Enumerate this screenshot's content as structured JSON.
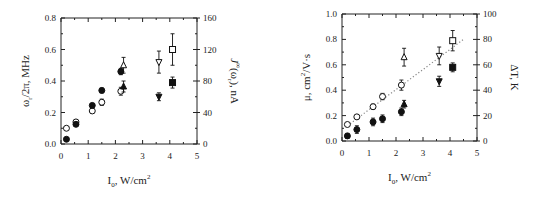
{
  "chart_data": [
    {
      "type": "scatter",
      "title": "",
      "xlabel": "I0, W/cm2",
      "xlabel_parts": {
        "main": "I",
        "sub": "0",
        "rest": ", W/cm",
        "sup": "2"
      },
      "ylabel": "ωr/2π, MHz",
      "ylabel_parts": {
        "main": "ω",
        "sub": "r",
        "rest": "/2π, MHz"
      },
      "y2label": "J∞(ωr), nA",
      "y2label_parts": {
        "main": "J",
        "sup": "∞",
        "mid": "(ω",
        "sub": "r",
        "rest": "), nA"
      },
      "xlim": [
        0,
        5
      ],
      "ylim": [
        0,
        0.8
      ],
      "y2lim": [
        0,
        160
      ],
      "xticks": [
        "0",
        "1",
        "2",
        "3",
        "4",
        "5"
      ],
      "yticks": [
        "0.0",
        "0.2",
        "0.4",
        "0.6",
        "0.8"
      ],
      "y2ticks": [
        "0",
        "40",
        "80",
        "120",
        "160"
      ],
      "grid": false,
      "series": [
        {
          "name": "open circles",
          "marker": "circle",
          "filled": false,
          "points": [
            {
              "x": 0.2,
              "y": 0.1,
              "err": 0.01
            },
            {
              "x": 0.55,
              "y": 0.14,
              "err": 0.012
            },
            {
              "x": 1.15,
              "y": 0.21,
              "err": 0.015
            },
            {
              "x": 1.5,
              "y": 0.265,
              "err": 0.02
            },
            {
              "x": 2.2,
              "y": 0.335,
              "err": 0.025
            }
          ]
        },
        {
          "name": "open up-triangle",
          "marker": "triangle-up",
          "filled": false,
          "points": [
            {
              "x": 2.3,
              "y": 0.5,
              "err": 0.05
            }
          ]
        },
        {
          "name": "open down-triangle",
          "marker": "triangle-down",
          "filled": false,
          "points": [
            {
              "x": 3.6,
              "y": 0.52,
              "err": 0.07
            }
          ]
        },
        {
          "name": "open square",
          "marker": "square",
          "filled": false,
          "points": [
            {
              "x": 4.1,
              "y": 0.6,
              "err": 0.1
            }
          ]
        },
        {
          "name": "filled circles",
          "marker": "circle",
          "filled": true,
          "points": [
            {
              "x": 0.2,
              "y": 0.03,
              "err": 0.005
            },
            {
              "x": 0.55,
              "y": 0.125,
              "err": 0.01
            },
            {
              "x": 1.15,
              "y": 0.245,
              "err": 0.012
            },
            {
              "x": 1.5,
              "y": 0.34,
              "err": 0.015
            },
            {
              "x": 2.2,
              "y": 0.46,
              "err": 0.02
            }
          ]
        },
        {
          "name": "filled up-triangle",
          "marker": "triangle-up",
          "filled": true,
          "points": [
            {
              "x": 2.3,
              "y": 0.365,
              "err": 0.035
            }
          ]
        },
        {
          "name": "filled down-triangle",
          "marker": "triangle-down",
          "filled": true,
          "points": [
            {
              "x": 3.6,
              "y": 0.3,
              "err": 0.025
            }
          ]
        },
        {
          "name": "filled square",
          "marker": "square",
          "filled": true,
          "points": [
            {
              "x": 4.1,
              "y": 0.39,
              "err": 0.035
            }
          ]
        }
      ]
    },
    {
      "type": "scatter",
      "title": "",
      "xlabel": "I0, W/cm2",
      "xlabel_parts": {
        "main": "I",
        "sub": "0",
        "rest": ", W/cm",
        "sup": "2"
      },
      "ylabel": "μ, cm2/V·s",
      "ylabel_parts": {
        "main": "μ, cm",
        "sup": "2",
        "rest": "/V·s"
      },
      "y2label": "ΔT, K",
      "xlim": [
        0,
        5
      ],
      "ylim": [
        0,
        1.0
      ],
      "y2lim": [
        0,
        100
      ],
      "xticks": [
        "0",
        "1",
        "2",
        "3",
        "4",
        "5"
      ],
      "yticks": [
        "0.0",
        "0.2",
        "0.4",
        "0.6",
        "0.8",
        "1.0"
      ],
      "y2ticks": [
        "0",
        "20",
        "40",
        "60",
        "80",
        "100"
      ],
      "grid": false,
      "fit_line": {
        "style": "dotted",
        "x": [
          0.2,
          4.5
        ],
        "y": [
          0.12,
          0.8
        ]
      },
      "series": [
        {
          "name": "open circles",
          "marker": "circle",
          "filled": false,
          "points": [
            {
              "x": 0.2,
              "y": 0.13,
              "err": 0.01
            },
            {
              "x": 0.55,
              "y": 0.19,
              "err": 0.012
            },
            {
              "x": 1.15,
              "y": 0.27,
              "err": 0.02
            },
            {
              "x": 1.5,
              "y": 0.35,
              "err": 0.025
            },
            {
              "x": 2.2,
              "y": 0.44,
              "err": 0.04
            }
          ]
        },
        {
          "name": "open up-triangle",
          "marker": "triangle-up",
          "filled": false,
          "points": [
            {
              "x": 2.3,
              "y": 0.66,
              "err": 0.07
            }
          ]
        },
        {
          "name": "open down-triangle",
          "marker": "triangle-down",
          "filled": false,
          "points": [
            {
              "x": 3.6,
              "y": 0.67,
              "err": 0.07
            }
          ]
        },
        {
          "name": "open square",
          "marker": "square",
          "filled": false,
          "points": [
            {
              "x": 4.1,
              "y": 0.79,
              "err": 0.08
            }
          ]
        },
        {
          "name": "filled circles",
          "marker": "circle",
          "filled": true,
          "points": [
            {
              "x": 0.2,
              "y": 0.04,
              "err": 0.02
            },
            {
              "x": 0.55,
              "y": 0.09,
              "err": 0.03
            },
            {
              "x": 1.15,
              "y": 0.15,
              "err": 0.03
            },
            {
              "x": 1.5,
              "y": 0.175,
              "err": 0.03
            },
            {
              "x": 2.2,
              "y": 0.23,
              "err": 0.03
            }
          ]
        },
        {
          "name": "filled up-triangle",
          "marker": "triangle-up",
          "filled": true,
          "points": [
            {
              "x": 2.3,
              "y": 0.29,
              "err": 0.03
            }
          ]
        },
        {
          "name": "filled down-triangle",
          "marker": "triangle-down",
          "filled": true,
          "points": [
            {
              "x": 3.6,
              "y": 0.47,
              "err": 0.04
            }
          ]
        },
        {
          "name": "filled square",
          "marker": "square",
          "filled": true,
          "points": [
            {
              "x": 4.1,
              "y": 0.58,
              "err": 0.035
            }
          ]
        }
      ]
    }
  ],
  "layout": {
    "panels": [
      {
        "left": 61,
        "top": 18,
        "width": 136,
        "height": 126
      },
      {
        "left": 342,
        "top": 14,
        "width": 135,
        "height": 127
      }
    ],
    "colors": {
      "axis": "#222222",
      "marker": "#111111",
      "fit": "#888888"
    }
  }
}
